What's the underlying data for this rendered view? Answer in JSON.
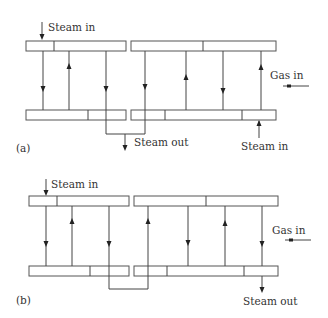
{
  "diagrams": [
    {
      "id": "a",
      "label": "(a)",
      "steam_in_top": "Steam in",
      "steam_out": "Steam out",
      "steam_in_bottom": "Steam in",
      "gas_in": "Gas in"
    },
    {
      "id": "b",
      "label": "(b)",
      "steam_in_top": "Steam in",
      "steam_out": "Steam out",
      "gas_in": "Gas in"
    }
  ]
}
